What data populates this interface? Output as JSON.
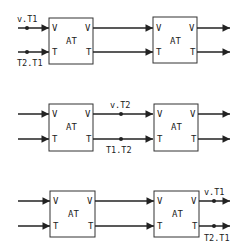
{
  "diagram": {
    "block_label": "AT",
    "port_in_v": "V",
    "port_in_t": "T",
    "port_out_v": "V",
    "port_out_t": "T",
    "rows": [
      {
        "id": "row1",
        "probe_position": "input",
        "v_label": "v.T1",
        "t_label": "T2.T1"
      },
      {
        "id": "row2",
        "probe_position": "between",
        "v_label": "v.T2",
        "t_label": "T1.T2"
      },
      {
        "id": "row3",
        "probe_position": "output",
        "v_label": "v.T1",
        "t_label": "T2.T1"
      }
    ]
  }
}
